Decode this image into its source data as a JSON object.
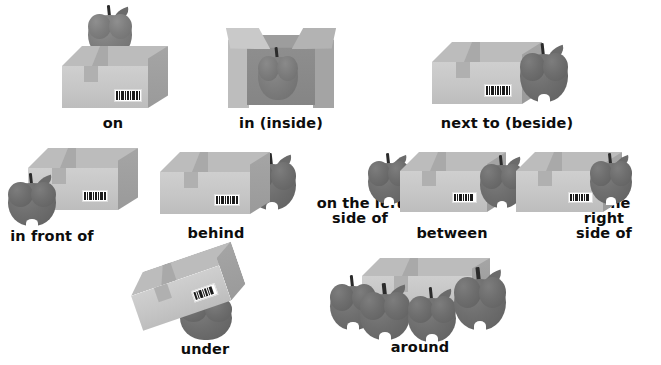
{
  "page": {
    "background_color": "#ffffff",
    "object_colors": {
      "box_front": "#c6c6c6",
      "box_side": "#9a9a9a",
      "box_top": "#bcbcbc",
      "box_tape": "#b0b0b0",
      "apple": "#7e7e7e",
      "apple_stem": "#2b2b2b",
      "text": "#0d0d0d"
    }
  },
  "rows": [
    {
      "row": 1,
      "items": [
        {
          "id": "on",
          "label": "on",
          "scene": "apple on top of a closed box"
        },
        {
          "id": "in",
          "label": "in (inside)",
          "scene": "apple inside an open box with flaps"
        },
        {
          "id": "next-to",
          "label": "next to (beside)",
          "scene": "apple beside a closed box on the right"
        }
      ]
    },
    {
      "row": 2,
      "items": [
        {
          "id": "in-front-of",
          "label": "in front of",
          "scene": "apple in front of a box"
        },
        {
          "id": "behind",
          "label": "behind",
          "scene": "apple behind a box"
        },
        {
          "id": "on-the-left-side-of",
          "label": "on the left\nside of",
          "scene": "apple at the left of two boxes"
        },
        {
          "id": "between",
          "label": "between",
          "scene": "apple between two boxes"
        },
        {
          "id": "on-the-right-side-of",
          "label": "on the right\nside of",
          "scene": "apple at the right of two boxes"
        }
      ]
    },
    {
      "row": 3,
      "items": [
        {
          "id": "under",
          "label": "under",
          "scene": "apple under a tilted box"
        },
        {
          "id": "around",
          "label": "around",
          "scene": "four apples around a box"
        }
      ]
    }
  ]
}
